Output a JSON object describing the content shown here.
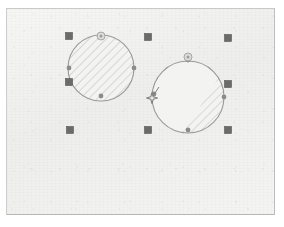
{
  "app": {
    "surface_name": "drawing-canvas",
    "background_color": "#f2f2f0",
    "border_color": "#c2c2c2",
    "page_width": 284,
    "page_height": 227
  },
  "canvas": {
    "x": 6,
    "y": 8,
    "width": 269,
    "height": 207
  },
  "styles": {
    "shape_stroke_color": "#9a9a9a",
    "shape_fill_color": "#f0f0ee",
    "hatch_color": "#c8c8c6",
    "handle_fill_color": "#6b6b6b",
    "handle_stroke_color": "#555555",
    "vertex_handle_color": "#8c8c8c",
    "rotation_handle_color": "#a6a6a6",
    "cursor_color": "#808080",
    "handle_size": 7
  },
  "shapes": [
    {
      "id": "circle-left",
      "name": "ellipse-shape-left",
      "type": "circle",
      "cx": 101,
      "cy": 68,
      "r": 33,
      "fill_style": "diagonal-hatch-full",
      "selected": true,
      "label": "Ellipse 1"
    },
    {
      "id": "circle-right",
      "name": "ellipse-shape-right",
      "type": "circle",
      "cx": 188,
      "cy": 97,
      "r": 36,
      "fill_style": "diagonal-hatch-partial",
      "selected": true,
      "label": "Ellipse 2"
    }
  ],
  "selection": {
    "name": "multi-shape-selection",
    "bounds": {
      "x": 69,
      "y": 36,
      "width": 159,
      "height": 94
    },
    "handles": [
      {
        "name": "handle-top-left",
        "x": 69,
        "y": 36,
        "cursor": "nw-resize"
      },
      {
        "name": "handle-top-center",
        "x": 148,
        "y": 37,
        "cursor": "n-resize"
      },
      {
        "name": "handle-top-right",
        "x": 228,
        "y": 38,
        "cursor": "ne-resize"
      },
      {
        "name": "handle-middle-left",
        "x": 69,
        "y": 82,
        "cursor": "w-resize"
      },
      {
        "name": "handle-middle-right",
        "x": 228,
        "y": 84,
        "cursor": "e-resize"
      },
      {
        "name": "handle-bottom-left",
        "x": 70,
        "y": 130,
        "cursor": "sw-resize"
      },
      {
        "name": "handle-bottom-center",
        "x": 148,
        "y": 130,
        "cursor": "s-resize"
      },
      {
        "name": "handle-bottom-right",
        "x": 228,
        "y": 130,
        "cursor": "se-resize"
      }
    ]
  },
  "vertex_handles": [
    {
      "name": "vertex-left-circle-north",
      "x": 101,
      "y": 35
    },
    {
      "name": "vertex-left-circle-east",
      "x": 134,
      "y": 68
    },
    {
      "name": "vertex-left-circle-south",
      "x": 101,
      "y": 96
    },
    {
      "name": "vertex-left-circle-west",
      "x": 69,
      "y": 68
    },
    {
      "name": "vertex-right-circle-north",
      "x": 188,
      "y": 60
    },
    {
      "name": "vertex-right-circle-east",
      "x": 224,
      "y": 97
    },
    {
      "name": "vertex-right-circle-south",
      "x": 188,
      "y": 130
    },
    {
      "name": "vertex-right-circle-west",
      "x": 154,
      "y": 94
    }
  ],
  "rotation_handles": [
    {
      "name": "rotation-handle-left-circle",
      "x": 101,
      "y": 36,
      "r": 4
    },
    {
      "name": "rotation-handle-right-circle",
      "x": 188,
      "y": 57,
      "r": 4
    }
  ],
  "cursor": {
    "name": "sparkle-cursor",
    "icon": "four-point-star-cursor",
    "x": 152,
    "y": 98,
    "size": 11
  }
}
